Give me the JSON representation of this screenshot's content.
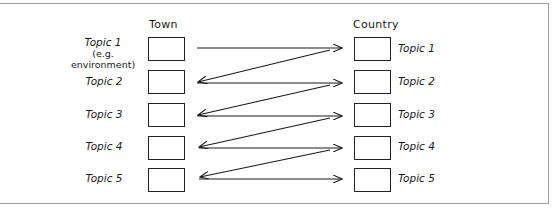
{
  "diagram": {
    "left_column": {
      "title": "Town",
      "topics": [
        {
          "label": "Topic 1",
          "sublabel": "(e.g. environment)"
        },
        {
          "label": "Topic 2"
        },
        {
          "label": "Topic 3"
        },
        {
          "label": "Topic 4"
        },
        {
          "label": "Topic 5"
        }
      ]
    },
    "right_column": {
      "title": "Country",
      "topics": [
        {
          "label": "Topic 1"
        },
        {
          "label": "Topic 2"
        },
        {
          "label": "Topic 3"
        },
        {
          "label": "Topic 4"
        },
        {
          "label": "Topic 5"
        }
      ]
    },
    "arrows": [
      {
        "from": "Town Topic 1",
        "to": "Country Topic 1"
      },
      {
        "from": "Country Topic 1",
        "to": "Town Topic 2"
      },
      {
        "from": "Town Topic 2",
        "to": "Country Topic 2"
      },
      {
        "from": "Country Topic 2",
        "to": "Town Topic 3"
      },
      {
        "from": "Town Topic 3",
        "to": "Country Topic 3"
      },
      {
        "from": "Country Topic 3",
        "to": "Town Topic 4"
      },
      {
        "from": "Town Topic 4",
        "to": "Country Topic 4"
      },
      {
        "from": "Country Topic 4",
        "to": "Town Topic 5"
      },
      {
        "from": "Town Topic 5",
        "to": "Country Topic 5"
      }
    ],
    "colors": {
      "line": "#1a1a1a",
      "frame": "#9a9a9a",
      "background": "#ffffff"
    }
  }
}
